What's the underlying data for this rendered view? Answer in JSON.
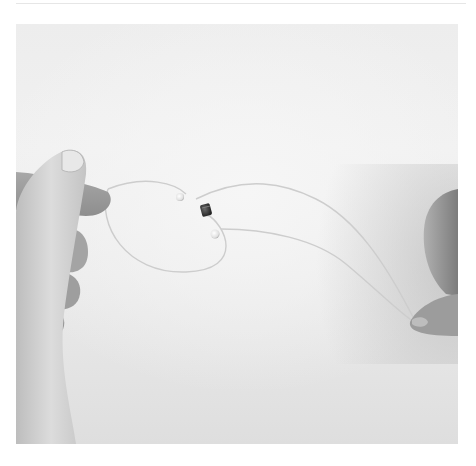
{
  "image": {
    "description": "Two hands holding a clear elastic beading cord threaded with two small clear beads and a dark metal crimp bead, against a white background",
    "palette": {
      "background": "#ffffff",
      "backdrop": "#ececec",
      "skin_light": "#d8d8d8",
      "skin_shadow": "#9a9a9a",
      "crimp_bead": "#2e2e2e",
      "clear_bead": "#f4f4f4",
      "cord": "#cfcfcf"
    },
    "elements": [
      {
        "name": "left-hand",
        "position": "left edge, pinching cord between thumb and fingers"
      },
      {
        "name": "right-hand",
        "position": "right edge, holding cord ends"
      },
      {
        "name": "elastic-cord",
        "position": "loop spanning center"
      },
      {
        "name": "clear-bead-1",
        "position": "center-left"
      },
      {
        "name": "crimp-bead",
        "position": "center"
      },
      {
        "name": "clear-bead-2",
        "position": "center, below crimp"
      }
    ]
  }
}
